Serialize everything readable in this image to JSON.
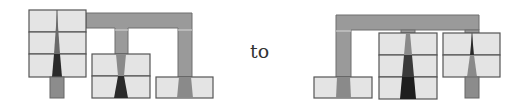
{
  "diagram": {
    "connector_label": "to",
    "colors": {
      "box_fill": "#e4e4e4",
      "box_stroke": "#555555",
      "bar_fill": "#9a9a9a",
      "wedge_dark": "#2a2a2a",
      "wedge_mid": "#6a6a6a",
      "wedge_light": "#8a8a8a"
    },
    "before": {
      "description": "Tree with a 3-row stack, a 2-row stack and a single box, connected by a top bar",
      "nodes": [
        {
          "name": "stack-a",
          "rows": 3
        },
        {
          "name": "stack-b",
          "rows": 2
        },
        {
          "name": "box-c",
          "rows": 1
        }
      ]
    },
    "after": {
      "description": "Tree with a single box, a 3-row stack and a 2-row stack, connected by a top bar",
      "nodes": [
        {
          "name": "box-c",
          "rows": 1
        },
        {
          "name": "stack-b",
          "rows": 3
        },
        {
          "name": "stack-a",
          "rows": 2
        }
      ]
    }
  }
}
